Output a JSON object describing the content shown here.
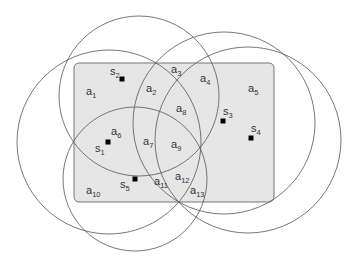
{
  "diagram": {
    "area_fill": "#e6e6e6",
    "area_stroke": "#777777",
    "circle_stroke": "#555555",
    "sensor_color": "#000000",
    "sensors": [
      {
        "name": "s",
        "sub": "1"
      },
      {
        "name": "s",
        "sub": "2"
      },
      {
        "name": "s",
        "sub": "3"
      },
      {
        "name": "s",
        "sub": "4"
      },
      {
        "name": "s",
        "sub": "5"
      }
    ],
    "regions": [
      {
        "name": "a",
        "sub": "1"
      },
      {
        "name": "a",
        "sub": "2"
      },
      {
        "name": "a",
        "sub": "3"
      },
      {
        "name": "a",
        "sub": "4"
      },
      {
        "name": "a",
        "sub": "5"
      },
      {
        "name": "a",
        "sub": "6"
      },
      {
        "name": "a",
        "sub": "7"
      },
      {
        "name": "a",
        "sub": "8"
      },
      {
        "name": "a",
        "sub": "9"
      },
      {
        "name": "a",
        "sub": "10"
      },
      {
        "name": "a",
        "sub": "11"
      },
      {
        "name": "a",
        "sub": "12"
      },
      {
        "name": "a",
        "sub": "13"
      }
    ]
  }
}
